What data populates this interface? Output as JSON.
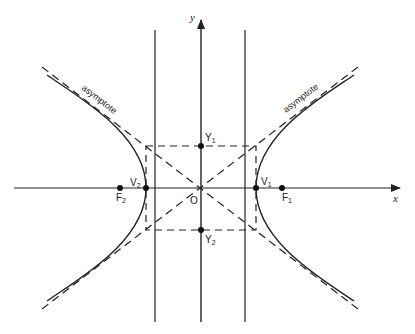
{
  "diagram": {
    "type": "hyperbola",
    "colors": {
      "stroke": "#222222",
      "background": "#ffffff"
    },
    "axes": {
      "x_label": "x",
      "y_label": "y"
    },
    "origin_label": "O",
    "points": {
      "V1": {
        "label": "V",
        "sub": "1"
      },
      "V2": {
        "label": "V",
        "sub": "2"
      },
      "F1": {
        "label": "F",
        "sub": "1"
      },
      "F2": {
        "label": "F",
        "sub": "2"
      },
      "Y1": {
        "label": "Y",
        "sub": "1"
      },
      "Y2": {
        "label": "Y",
        "sub": "2"
      }
    },
    "asymptote_labels": {
      "left": "asymptote",
      "right": "asymptote"
    }
  }
}
